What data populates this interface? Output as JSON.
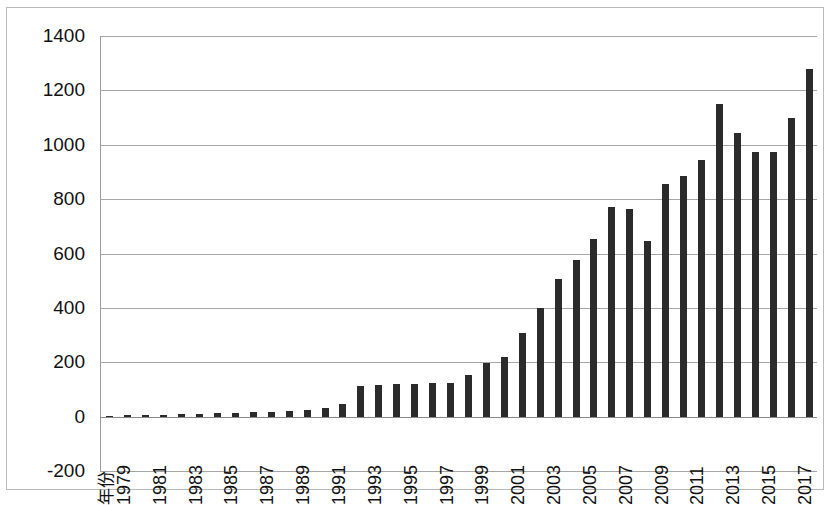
{
  "chart_data": {
    "type": "bar",
    "title": "",
    "xlabel": "年份",
    "ylabel": "",
    "ylim": [
      -200,
      1400
    ],
    "yticks": [
      -200,
      0,
      200,
      400,
      600,
      800,
      1000,
      1200,
      1400
    ],
    "ytick_labels": [
      "-200",
      "0",
      "200",
      "400",
      "600",
      "800",
      "1000",
      "1200",
      "1400"
    ],
    "grid": true,
    "legend": false,
    "bar_color": "#2b2b2b",
    "x_label_interval": 2,
    "x_first_label": "年份",
    "categories": [
      "1978",
      "1979",
      "1980",
      "1981",
      "1982",
      "1983",
      "1984",
      "1985",
      "1986",
      "1987",
      "1988",
      "1989",
      "1990",
      "1991",
      "1992",
      "1993",
      "1994",
      "1995",
      "1996",
      "1997",
      "1998",
      "1999",
      "2000",
      "2001",
      "2002",
      "2003",
      "2004",
      "2005",
      "2006",
      "2007",
      "2008",
      "2009",
      "2010",
      "2011",
      "2012",
      "2013",
      "2014",
      "2015",
      "2016",
      "2017"
    ],
    "values": [
      3,
      5,
      6,
      7,
      8,
      10,
      12,
      14,
      16,
      18,
      22,
      26,
      32,
      48,
      112,
      118,
      120,
      120,
      122,
      122,
      152,
      196,
      218,
      308,
      398,
      505,
      575,
      655,
      770,
      765,
      645,
      855,
      885,
      945,
      1150,
      1045,
      975,
      975,
      1100,
      1280
    ],
    "xtick_labels": [
      "年份",
      "1979",
      "1981",
      "1983",
      "1985",
      "1987",
      "1989",
      "1991",
      "1993",
      "1995",
      "1997",
      "1999",
      "2001",
      "2003",
      "2005",
      "2007",
      "2009",
      "2011",
      "2013",
      "2015",
      "2017"
    ]
  }
}
